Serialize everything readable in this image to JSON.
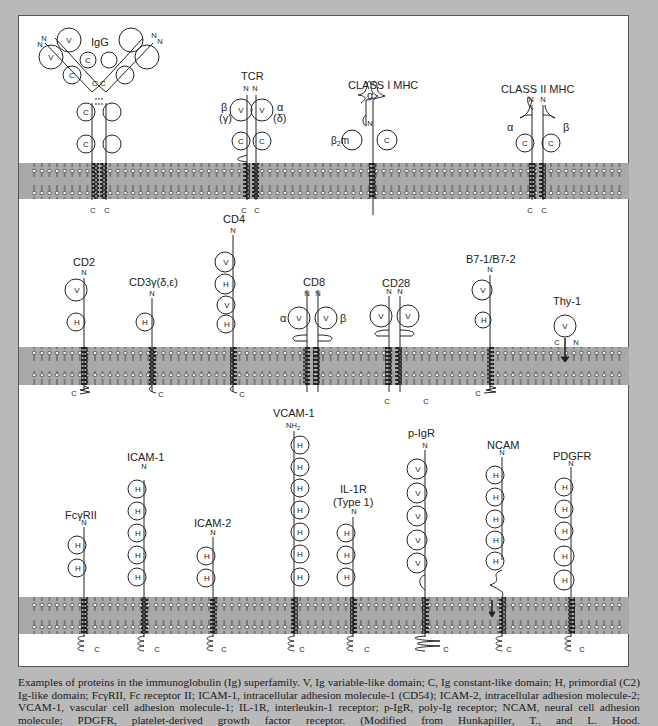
{
  "figure": {
    "colors": {
      "background_frame": "#b9b9b9",
      "panel": "#ffffff",
      "membrane": "#a9a9a9",
      "ink": "#222222"
    },
    "rows": [
      {
        "proteins": [
          {
            "name": "IgG",
            "domains": [
              "V",
              "C",
              "C",
              "C",
              "V",
              "C",
              "C",
              "C"
            ],
            "termini": [
              "N",
              "N",
              "N",
              "N",
              "C",
              "C"
            ]
          },
          {
            "name": "TCR",
            "chains": [
              {
                "label": "β",
                "alt": "(γ)"
              },
              {
                "label": "α",
                "alt": "(δ)"
              }
            ],
            "domains": [
              "V",
              "V",
              "C",
              "C"
            ],
            "termini": [
              "N",
              "N",
              "C",
              "C"
            ]
          },
          {
            "name": "CLASS I MHC",
            "chain_labels": [
              "α",
              "β2m"
            ],
            "domains": [
              "C"
            ],
            "termini": [
              "N",
              "C"
            ]
          },
          {
            "name": "CLASS II MHC",
            "chain_labels": [
              "α",
              "β"
            ],
            "domains": [
              "C",
              "C"
            ],
            "termini": [
              "N",
              "N",
              "C",
              "C"
            ]
          }
        ]
      },
      {
        "proteins": [
          {
            "name": "CD2",
            "domains": [
              "V",
              "H"
            ],
            "termini": [
              "N",
              "C"
            ]
          },
          {
            "name": "CD3γ(δ,ε)",
            "domains": [
              "H"
            ],
            "termini": [
              "N",
              "C"
            ]
          },
          {
            "name": "CD4",
            "domains": [
              "V",
              "H",
              "V",
              "H"
            ],
            "termini": [
              "N",
              "C"
            ]
          },
          {
            "name": "CD8",
            "chain_labels": [
              "α",
              "β"
            ],
            "domains": [
              "V",
              "V"
            ],
            "termini": [
              "N",
              "N",
              "C",
              "C"
            ]
          },
          {
            "name": "CD28",
            "domains": [
              "V",
              "V"
            ],
            "termini": [
              "N",
              "N",
              "C",
              "C"
            ]
          },
          {
            "name": "B7-1/B7-2",
            "domains": [
              "V",
              "H"
            ],
            "termini": [
              "N",
              "C"
            ]
          },
          {
            "name": "Thy-1",
            "domains": [
              "V"
            ],
            "termini": [
              "C",
              "N"
            ]
          }
        ]
      },
      {
        "proteins": [
          {
            "name": "FcγRII",
            "domains": [
              "H",
              "H"
            ],
            "termini": [
              "N",
              "C"
            ]
          },
          {
            "name": "ICAM-1",
            "domains": [
              "H",
              "H",
              "H",
              "H",
              "H"
            ],
            "termini": [
              "N",
              "C"
            ]
          },
          {
            "name": "ICAM-2",
            "domains": [
              "H",
              "H"
            ],
            "termini": [
              "N",
              "C"
            ]
          },
          {
            "name": "VCAM-1",
            "domains": [
              "H",
              "H",
              "H",
              "H",
              "H",
              "H",
              "H"
            ],
            "termini": [
              "NH2",
              "C"
            ]
          },
          {
            "name": "IL-1R",
            "subtitle": "(Type 1)",
            "domains": [
              "H",
              "H",
              "H"
            ],
            "termini": [
              "N",
              "C"
            ]
          },
          {
            "name": "p-IgR",
            "domains": [
              "V",
              "V",
              "V",
              "V",
              "V"
            ],
            "termini": [
              "N",
              "C"
            ]
          },
          {
            "name": "NCAM",
            "domains": [
              "H",
              "H",
              "H",
              "H",
              "H"
            ],
            "termini": [
              "N",
              "C"
            ]
          },
          {
            "name": "PDGFR",
            "domains": [
              "H",
              "H",
              "H",
              "H",
              "H"
            ],
            "termini": [
              "N",
              "C"
            ]
          }
        ]
      }
    ],
    "labels": {
      "igg": "IgG",
      "tcr": "TCR",
      "mhc1": "CLASS I MHC",
      "mhc2": "CLASS II MHC",
      "cd2": "CD2",
      "cd3": "CD3γ(δ,ε)",
      "cd4": "CD4",
      "cd8": "CD8",
      "cd28": "CD28",
      "b7": "B7-1/B7-2",
      "thy1": "Thy-1",
      "fcgr": "FcγRII",
      "icam1": "ICAM-1",
      "icam2": "ICAM-2",
      "vcam1": "VCAM-1",
      "il1r": "IL-1R",
      "il1r_sub": "(Type 1)",
      "pigr": "p-IgR",
      "ncam": "NCAM",
      "pdgfr": "PDGFR",
      "N": "N",
      "C": "C",
      "NH2": "NH",
      "NH2_sub": "2",
      "V": "V",
      "H": "H",
      "Cdom": "C",
      "alpha": "α",
      "beta": "β",
      "gamma_paren": "(γ)",
      "delta_paren": "(δ)",
      "beta2m": "β",
      "beta2m_sub": "2",
      "beta2m_m": "m"
    }
  },
  "caption": {
    "text": "Examples of proteins in the immunoglobulin (Ig) superfamily. V, Ig variable-like domain; C, Ig constant-like domain; H, primordial (C2) Ig-like domain; FcγRII, Fc receptor II; ICAM-1, intracellular adhesion molecule-1 (CD54); ICAM-2, intracellular adhesion molecule-2; VCAM-1, vascular cell adhesion molecule-1; IL-1R, interleukin-1 receptor; p-IgR, poly-Ig receptor; NCAM, neural cell adhesion molecule; PDGFR, platelet-derived growth factor receptor. (Modified from Hunkapiller, T., and L. Hood."
  }
}
